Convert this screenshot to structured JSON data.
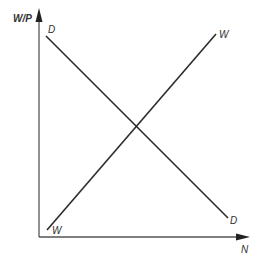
{
  "diagram": {
    "type": "labor market supply-demand",
    "axes": {
      "y_label": "W/P",
      "x_label": "N"
    },
    "curves": [
      {
        "name": "demand",
        "label_start": "D",
        "label_end": "D",
        "slope": "downward"
      },
      {
        "name": "supply",
        "label_start": "W",
        "label_end": "W",
        "slope": "upward"
      }
    ],
    "colors": {
      "line": "#2b2b2b",
      "axis": "#555555",
      "text": "#333333"
    }
  }
}
